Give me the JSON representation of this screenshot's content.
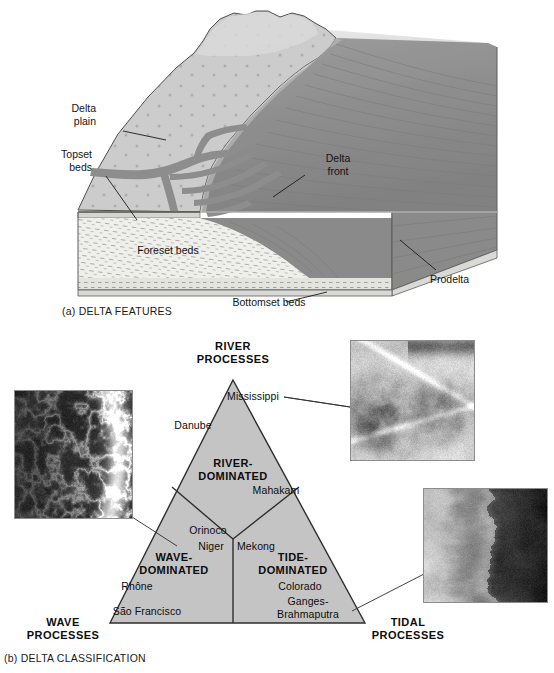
{
  "figure": {
    "panel_a": {
      "caption": "(a) DELTA FEATURES",
      "labels": [
        {
          "name": "delta-plain",
          "text_line1": "Delta",
          "text_line2": "plain"
        },
        {
          "name": "topset-beds",
          "text_line1": "Topset",
          "text_line2": "beds"
        },
        {
          "name": "foreset-beds",
          "text_line1": "Foreset beds",
          "text_line2": ""
        },
        {
          "name": "bottomset-beds",
          "text_line1": "Bottomset beds",
          "text_line2": ""
        },
        {
          "name": "delta-front",
          "text_line1": "Delta",
          "text_line2": "front"
        },
        {
          "name": "prodelta",
          "text_line1": "Prodelta",
          "text_line2": ""
        }
      ],
      "delta_plain_line1": "Delta",
      "delta_plain_line2": "plain",
      "topset_line1": "Topset",
      "topset_line2": "beds",
      "foreset": "Foreset beds",
      "bottomset": "Bottomset beds",
      "delta_front_line1": "Delta",
      "delta_front_line2": "front",
      "prodelta": "Prodelta"
    },
    "panel_b": {
      "caption": "(b) DELTA CLASSIFICATION",
      "corners": {
        "river_line1": "RIVER",
        "river_line2": "PROCESSES",
        "wave_line1": "WAVE",
        "wave_line2": "PROCESSES",
        "tidal_line1": "TIDAL",
        "tidal_line2": "PROCESSES"
      },
      "zones": {
        "river_line1": "RIVER-",
        "river_line2": "DOMINATED",
        "wave_line1": "WAVE-",
        "wave_line2": "DOMINATED",
        "tide_line1": "TIDE-",
        "tide_line2": "DOMINATED"
      },
      "rivers": {
        "mississippi": "Mississippi",
        "danube": "Danube",
        "mahakam": "Mahakam",
        "orinoco": "Orinoco",
        "niger": "Niger",
        "mekong": "Mekong",
        "rhone": "Rhône",
        "sao_francisco": "São Francisco",
        "colorado": "Colorado",
        "ganges_line1": "Ganges-",
        "ganges_line2": "Brahmaputra"
      },
      "photos": [
        {
          "name": "wave-dominated-delta-photo",
          "subject": "wave-dominated delta satellite image"
        },
        {
          "name": "river-dominated-delta-photo",
          "subject": "Mississippi birdsfoot delta aerial image"
        },
        {
          "name": "tide-dominated-delta-photo",
          "subject": "tide-dominated delta satellite image"
        }
      ]
    }
  },
  "colors": {
    "delta_plain": "#c9c9c9",
    "delta_plain_light": "#d6d6d6",
    "water": "#8f8f8f",
    "water_dark": "#7d7d7d",
    "foreset": "#ededea",
    "side_face": "#9a9a9a",
    "triangle_fill": "#c3c3c3",
    "outline": "#3a3a3a",
    "text": "#141414"
  }
}
